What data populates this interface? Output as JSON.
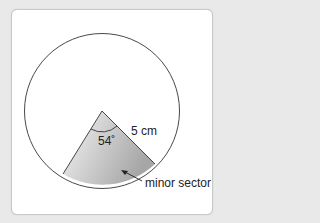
{
  "diagram": {
    "angle_label": "54˚",
    "radius_label": "5 cm",
    "sector_label": "minor sector",
    "colors": {
      "background": "#e9e9e9",
      "card": "#ffffff",
      "stroke": "#333333",
      "sector_light": "#f4f4f4",
      "sector_dark": "#a8a8a8"
    }
  }
}
